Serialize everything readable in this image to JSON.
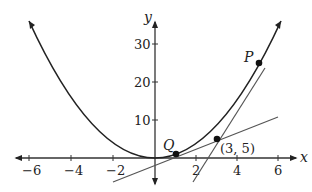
{
  "diagram": {
    "axes": {
      "x_label": "x",
      "y_label": "y",
      "x_ticks": [
        "−6",
        "−4",
        "−2",
        "2",
        "4",
        "6"
      ],
      "y_ticks": [
        "10",
        "20",
        "30"
      ]
    },
    "curve": {
      "equation": "y = x^2",
      "color": "#222222"
    },
    "tangents": [
      {
        "name": "tangent-at-Q",
        "equation": "y = 2x - 1",
        "color": "#555555"
      },
      {
        "name": "tangent-at-P",
        "equation": "y = 10x - 25",
        "color": "#555555"
      }
    ],
    "points": {
      "P": {
        "label": "P",
        "x": 5,
        "y": 25
      },
      "Q": {
        "label": "Q",
        "x": 1,
        "y": 1
      },
      "intersection": {
        "label": "(3, 5)",
        "x": 3,
        "y": 5
      }
    }
  }
}
